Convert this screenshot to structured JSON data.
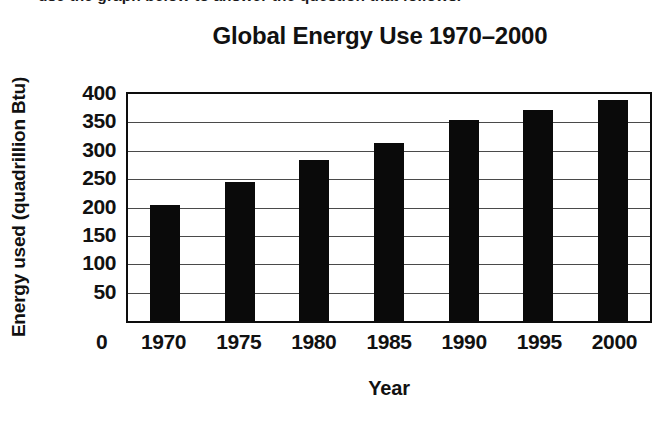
{
  "caption_fragment": "use the graph below to answer the question that follows.",
  "chart_data": {
    "type": "bar",
    "title": "Global Energy Use 1970–2000",
    "xlabel": "Year",
    "ylabel": "Energy used (quadrillion Btu)",
    "categories": [
      "1970",
      "1975",
      "1980",
      "1985",
      "1990",
      "1995",
      "2000"
    ],
    "values": [
      205,
      245,
      283,
      314,
      355,
      371,
      390
    ],
    "ylim": [
      0,
      400
    ],
    "y_ticks": [
      400,
      350,
      300,
      250,
      200,
      150,
      100,
      50
    ],
    "y_tick_labels": [
      "400",
      "350",
      "300",
      "250",
      "200",
      "150",
      "100",
      "50"
    ],
    "origin_label": "0",
    "grid": true,
    "legend": null,
    "bar_color": "#0a0a0a",
    "axis_color": "#0d0d0d",
    "gridline_color": "#4a4a4a"
  }
}
